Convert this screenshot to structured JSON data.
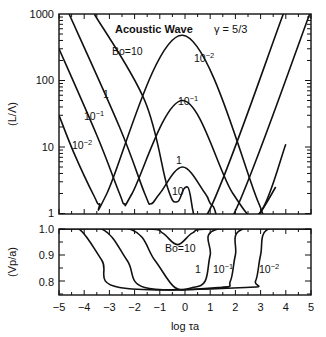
{
  "chart_data": [
    {
      "type": "line",
      "panel": "top",
      "title": "Acoustic Wave",
      "subtitle": "γ = 5/3",
      "xlabel": "log τa",
      "ylabel": "(L/Λ)",
      "yscale": "log",
      "xlim": [
        -5,
        5
      ],
      "ylim": [
        1,
        1000
      ],
      "yticks": [
        "1",
        "10",
        "100",
        "1000"
      ],
      "grid": false,
      "series": [
        {
          "name": "Bo=10",
          "x": [
            -3.6,
            -1.6,
            -0.7,
            -0.3,
            0.1,
            0.9,
            3.9
          ],
          "y": [
            1000,
            50,
            2.5,
            1.5,
            2.5,
            1.0,
            1000
          ]
        },
        {
          "name": "1",
          "x": [
            -4.6,
            -2.6,
            -1.6,
            -1.35,
            -1.0,
            -0.1,
            0.8,
            1.1,
            1.95,
            4.95
          ],
          "y": [
            1000,
            20,
            2.0,
            1.4,
            2.0,
            5,
            2.0,
            1.3,
            1.0,
            1000
          ]
        },
        {
          "name": "10^-1",
          "x": [
            -5.0,
            -3.5,
            -2.6,
            -2.4,
            -2.1,
            -0.1,
            1.9,
            2.95,
            4.0
          ],
          "y": [
            300,
            15,
            2.0,
            1.4,
            2.0,
            50,
            2.0,
            1.0,
            11
          ]
        },
        {
          "name": "10^-2",
          "x": [
            -5.0,
            -4.4,
            -3.6,
            -3.4,
            -3.1,
            -0.1,
            2.9,
            2.95,
            3.6
          ],
          "y": [
            30,
            8,
            1.8,
            1.4,
            2.0,
            480,
            1.5,
            1.0,
            2.5
          ]
        }
      ],
      "annotations": [
        "Bo=10",
        "1",
        "10^-1",
        "10^-2",
        "10^-2",
        "10^-1",
        "1",
        "10"
      ]
    },
    {
      "type": "line",
      "panel": "bottom",
      "xlabel": "log τa",
      "ylabel": "(Vp/a)",
      "xlim": [
        -5,
        5
      ],
      "ylim": [
        0.75,
        1.0
      ],
      "xticks": [
        "-5",
        "-4",
        "-3",
        "-2",
        "-1",
        "0",
        "1",
        "2",
        "3",
        "4",
        "5"
      ],
      "yticks": [
        "0.8",
        "0.9",
        "1.0"
      ],
      "grid": false,
      "series": [
        {
          "name": "Bo=10",
          "x": [
            -5,
            -1.5,
            -0.9,
            -0.3,
            0.3,
            1.0,
            5
          ],
          "y": [
            1.0,
            1.0,
            0.985,
            0.94,
            0.985,
            1.0,
            1.0
          ]
        },
        {
          "name": "1",
          "x": [
            -5,
            -2.2,
            -1.2,
            -0.4,
            0.3,
            0.8,
            1.0,
            1.3,
            5
          ],
          "y": [
            1.0,
            1.0,
            0.88,
            0.775,
            0.775,
            0.8,
            0.9,
            1.0,
            1.0
          ]
        },
        {
          "name": "10^-1",
          "x": [
            -5,
            -3.3,
            -2.3,
            -1.6,
            1.4,
            1.8,
            2.0,
            2.3,
            5
          ],
          "y": [
            1.0,
            1.0,
            0.88,
            0.775,
            0.775,
            0.8,
            0.9,
            1.0,
            1.0
          ]
        },
        {
          "name": "10^-2",
          "x": [
            -5,
            -4.2,
            -3.3,
            -2.6,
            2.4,
            2.8,
            3.0,
            3.3,
            5
          ],
          "y": [
            1.0,
            1.0,
            0.88,
            0.775,
            0.775,
            0.8,
            0.9,
            1.0,
            1.0
          ]
        }
      ],
      "annotations": [
        "Bo=10",
        "1",
        "10^-1",
        "10^-2"
      ]
    }
  ],
  "labels": {
    "title": "Acoustic Wave",
    "gamma": "γ = 5/3",
    "top_ylabel": "(L/Λ)",
    "bottom_ylabel": "(Vp/a)",
    "xlabel": "log τa",
    "top_yticks": [
      "1000",
      "100",
      "10",
      "1"
    ],
    "bottom_yticks": [
      "1.0",
      "0.9",
      "0.8"
    ],
    "xticks": [
      "−5",
      "−4",
      "−3",
      "−2",
      "−1",
      "0",
      "1",
      "2",
      "3",
      "4",
      "5"
    ],
    "top_ann": {
      "bo10": "Bo=10",
      "one_left": "1",
      "m1_left": "10",
      "m1_left_exp": "−1",
      "m2_left": "10",
      "m2_left_exp": "−2",
      "m2_peak": "10",
      "m2_peak_exp": "−2",
      "m1_peak": "10",
      "m1_peak_exp": "−1",
      "one_peak": "1",
      "ten_min": "10"
    },
    "bottom_ann": {
      "bo10": "Bo=10",
      "one": "1",
      "m1": "10",
      "m1_exp": "−1",
      "m2": "10",
      "m2_exp": "−2"
    }
  }
}
